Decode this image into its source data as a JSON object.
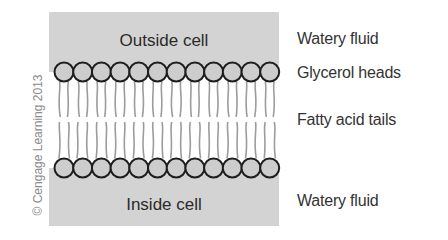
{
  "diagram": {
    "regions": {
      "outside": "Outside cell",
      "inside": "Inside cell"
    },
    "labels": {
      "top_fluid": "Watery fluid",
      "heads": "Glycerol heads",
      "tails": "Fatty acid tails",
      "bottom_fluid": "Watery fluid"
    },
    "copyright": "© Cengage Learning 2013",
    "heads_per_layer": 12,
    "colors": {
      "fluid_background": "#d3d3d3",
      "head_fill": "#cdcdcd",
      "head_stroke": "#1e1e1e",
      "tail_stroke": "#9c9c9c",
      "text": "#333333",
      "copyright": "#8a8a8a"
    }
  }
}
